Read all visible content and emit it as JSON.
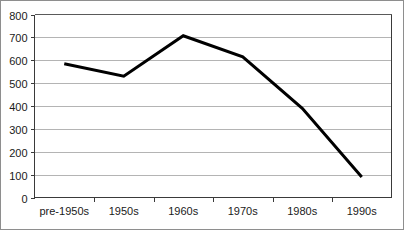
{
  "chart_data": {
    "type": "line",
    "title": "",
    "subtitle": "",
    "xlabel": "",
    "ylabel": "",
    "categories": [
      "pre-1950s",
      "1950s",
      "1960s",
      "1970s",
      "1980s",
      "1990s"
    ],
    "values": [
      585,
      530,
      707,
      615,
      390,
      90
    ],
    "series": [
      {
        "name": "",
        "values": [
          585,
          530,
          707,
          615,
          390,
          90
        ]
      }
    ],
    "ylim": [
      0,
      800
    ],
    "yticks": [
      0,
      100,
      200,
      300,
      400,
      500,
      600,
      700,
      800
    ],
    "ytick_labels": [
      "0",
      "100",
      "200",
      "300",
      "400",
      "500",
      "600",
      "700",
      "800"
    ],
    "xtick_labels": [
      "pre-1950s",
      "1950s",
      "1960s",
      "1970s",
      "1980s",
      "1990s"
    ],
    "grid": "horizontal",
    "legend": "none",
    "annotations": [],
    "colors": {
      "line": "#000000",
      "gridline": "#b4b4b4",
      "axis": "#3a3a3a",
      "frame": "#5a5a5a",
      "background": "#ffffff",
      "text": "#1a1a1a"
    }
  }
}
